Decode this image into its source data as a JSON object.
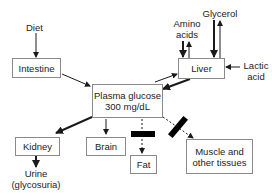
{
  "diagram": {
    "type": "flow-diagram",
    "nodes": {
      "diet": {
        "label": "Diet"
      },
      "intestine": {
        "label": "Intestine"
      },
      "plasma_glucose": {
        "line1": "Plasma glucose",
        "line2": "300 mg/dL"
      },
      "liver": {
        "label": "Liver"
      },
      "amino_acids": {
        "line1": "Amino",
        "line2": "acids"
      },
      "glycerol": {
        "label": "Glycerol"
      },
      "lactic_acid": {
        "line1": "Lactic",
        "line2": "acid"
      },
      "kidney": {
        "label": "Kidney"
      },
      "urine": {
        "line1": "Urine",
        "line2": "(glycosuria)"
      },
      "brain": {
        "label": "Brain"
      },
      "fat": {
        "label": "Fat"
      },
      "muscle": {
        "line1": "Muscle and",
        "line2": "other tissues"
      }
    },
    "edges": [
      {
        "from": "Diet",
        "to": "Intestine",
        "style": "thin"
      },
      {
        "from": "Intestine",
        "to": "Plasma glucose",
        "style": "thin"
      },
      {
        "from": "Plasma glucose",
        "to": "Liver",
        "style": "thin"
      },
      {
        "from": "Liver",
        "to": "Plasma glucose",
        "style": "thick"
      },
      {
        "from": "Amino acids",
        "to": "Liver",
        "style": "thick"
      },
      {
        "from": "Liver",
        "to": "Amino acids",
        "style": "thin"
      },
      {
        "from": "Glycerol",
        "to": "Liver",
        "style": "thick"
      },
      {
        "from": "Liver",
        "to": "Glycerol",
        "style": "thin"
      },
      {
        "from": "Lactic acid",
        "to": "Liver",
        "style": "thin"
      },
      {
        "from": "Plasma glucose",
        "to": "Kidney",
        "style": "thick"
      },
      {
        "from": "Kidney",
        "to": "Urine (glycosuria)",
        "style": "thick"
      },
      {
        "from": "Plasma glucose",
        "to": "Brain",
        "style": "thin"
      },
      {
        "from": "Plasma glucose",
        "to": "Fat",
        "style": "dashed",
        "blocked": true
      },
      {
        "from": "Plasma glucose",
        "to": "Muscle and other tissues",
        "style": "dashed",
        "blocked": true
      }
    ],
    "colors": {
      "line": "#1a1a1a",
      "box_border": "#8a8a8a",
      "block_bar": "#000000",
      "background": "#ffffff"
    }
  }
}
